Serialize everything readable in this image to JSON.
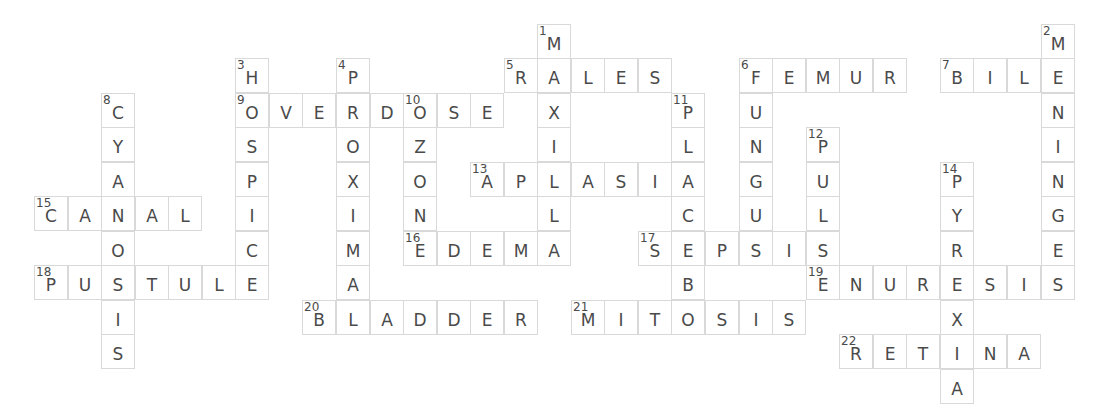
{
  "puzzle": {
    "grid": {
      "origin_x": 34,
      "origin_y": 24,
      "cell_w": 33.55,
      "cell_h": 34.45
    },
    "words": [
      {
        "number": 1,
        "answer": "MAXILLA",
        "direction": "down",
        "col": 15,
        "row": 0
      },
      {
        "number": 2,
        "answer": "MENINGES",
        "direction": "down",
        "col": 30,
        "row": 0
      },
      {
        "number": 3,
        "answer": "HOSPICE",
        "direction": "down",
        "col": 6,
        "row": 1
      },
      {
        "number": 4,
        "answer": "PROXIMAL",
        "direction": "down",
        "col": 9,
        "row": 1
      },
      {
        "number": 5,
        "answer": "RALES",
        "direction": "across",
        "col": 14,
        "row": 1
      },
      {
        "number": 6,
        "answer": "FEMUR",
        "direction": "across",
        "col": 21,
        "row": 1
      },
      {
        "number": 6,
        "answer": "FUNGUS",
        "direction": "down",
        "col": 21,
        "row": 1
      },
      {
        "number": 7,
        "answer": "BILE",
        "direction": "across",
        "col": 27,
        "row": 1
      },
      {
        "number": 8,
        "answer": "CYANOSIS",
        "direction": "down",
        "col": 2,
        "row": 2
      },
      {
        "number": 9,
        "answer": "OVERDOSE",
        "direction": "across",
        "col": 6,
        "row": 2
      },
      {
        "number": 10,
        "answer": "OZONE",
        "direction": "down",
        "col": 11,
        "row": 2
      },
      {
        "number": 11,
        "answer": "PLACEBO",
        "direction": "down",
        "col": 19,
        "row": 2
      },
      {
        "number": 12,
        "answer": "PULSE",
        "direction": "down",
        "col": 23,
        "row": 3
      },
      {
        "number": 13,
        "answer": "APLASIA",
        "direction": "across",
        "col": 13,
        "row": 4
      },
      {
        "number": 14,
        "answer": "PYREXIA",
        "direction": "down",
        "col": 27,
        "row": 4
      },
      {
        "number": 15,
        "answer": "CANAL",
        "direction": "across",
        "col": 0,
        "row": 5
      },
      {
        "number": 16,
        "answer": "EDEMA",
        "direction": "across",
        "col": 11,
        "row": 6
      },
      {
        "number": 17,
        "answer": "SEPSIS",
        "direction": "across",
        "col": 18,
        "row": 6
      },
      {
        "number": 18,
        "answer": "PUSTULE",
        "direction": "across",
        "col": 0,
        "row": 7
      },
      {
        "number": 19,
        "answer": "ENURESIS",
        "direction": "across",
        "col": 23,
        "row": 7
      },
      {
        "number": 20,
        "answer": "BLADDER",
        "direction": "across",
        "col": 8,
        "row": 8
      },
      {
        "number": 21,
        "answer": "MITOSIS",
        "direction": "across",
        "col": 16,
        "row": 8
      },
      {
        "number": 22,
        "answer": "RETINA",
        "direction": "across",
        "col": 24,
        "row": 9
      }
    ]
  },
  "colors": {
    "border": "#d9d9d9",
    "text": "#4a4a4a",
    "background": "#ffffff"
  }
}
